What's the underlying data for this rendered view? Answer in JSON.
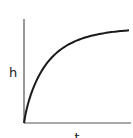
{
  "chart_data": {
    "type": "line",
    "title": "",
    "xlabel": "t",
    "ylabel": "h",
    "grid": false,
    "legend": null,
    "x_ticks": [],
    "y_ticks": [],
    "series": [
      {
        "name": "h(t)",
        "x": [
          0,
          0.05,
          0.1,
          0.2,
          0.3,
          0.4,
          0.5,
          0.6,
          0.7,
          0.8,
          0.9,
          1.0
        ],
        "values": [
          0,
          0.28,
          0.42,
          0.6,
          0.72,
          0.8,
          0.86,
          0.9,
          0.93,
          0.95,
          0.96,
          0.97
        ]
      }
    ],
    "xlim": [
      0,
      1
    ],
    "ylim": [
      0,
      1.1
    ],
    "colors": {
      "axis": "#555555",
      "curve": "#1a1a1a",
      "text": "#222222"
    }
  }
}
